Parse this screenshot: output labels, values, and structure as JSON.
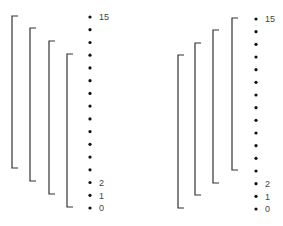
{
  "panels": [
    {
      "id": "left",
      "dots_x": 90,
      "dot_y_top": 17,
      "dot_y_bottom": 208,
      "dot_count": 16,
      "label_x": 99,
      "labels": [
        {
          "text": "15",
          "index": 15
        },
        {
          "text": "2",
          "index": 2
        },
        {
          "text": "1",
          "index": 1
        },
        {
          "text": "0",
          "index": 0
        }
      ],
      "brackets": [
        {
          "x": 12,
          "top": 16,
          "bottom": 168
        },
        {
          "x": 30,
          "top": 28,
          "bottom": 181
        },
        {
          "x": 49,
          "top": 41,
          "bottom": 194
        },
        {
          "x": 67,
          "top": 54,
          "bottom": 207
        }
      ]
    },
    {
      "id": "right",
      "dots_x": 256,
      "dot_y_top": 19,
      "dot_y_bottom": 209,
      "dot_count": 16,
      "label_x": 265,
      "labels": [
        {
          "text": "15",
          "index": 15
        },
        {
          "text": "2",
          "index": 2
        },
        {
          "text": "1",
          "index": 1
        },
        {
          "text": "0",
          "index": 0
        }
      ],
      "brackets": [
        {
          "x": 178,
          "top": 55,
          "bottom": 208
        },
        {
          "x": 195,
          "top": 43,
          "bottom": 195
        },
        {
          "x": 213,
          "top": 30,
          "bottom": 183
        },
        {
          "x": 232,
          "top": 18,
          "bottom": 170
        }
      ]
    }
  ],
  "style": {
    "line_color": "#333333",
    "dot_color": "#111111",
    "tick_length": 6
  }
}
